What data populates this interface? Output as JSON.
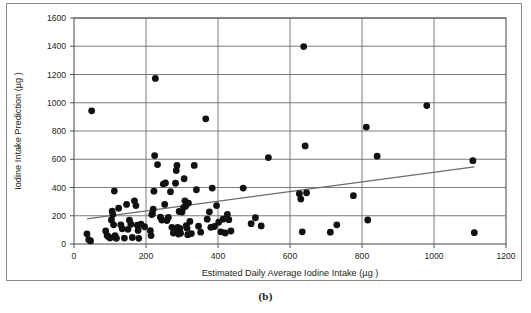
{
  "figure": {
    "caption": "(b)",
    "background_color": "#ffffff",
    "frame_color": "#8a8a8a"
  },
  "chart_data": {
    "type": "scatter",
    "title": "",
    "xlabel": "Estimated Daily Average Iodine Intake (µg )",
    "ylabel": "Iodine Intake Prediction (µg )",
    "xlim": [
      0,
      1200
    ],
    "ylim": [
      0,
      1600
    ],
    "xticks": [
      0,
      200,
      400,
      600,
      800,
      1000,
      1200
    ],
    "yticks": [
      0,
      200,
      400,
      600,
      800,
      1000,
      1200,
      1400,
      1600
    ],
    "xtick_labels": [
      "0",
      "200",
      "400",
      "600",
      "800",
      "1000",
      "1200"
    ],
    "ytick_labels": [
      "0",
      "200",
      "400",
      "600",
      "800",
      "1000",
      "1200",
      "1400",
      "1600"
    ],
    "grid": true,
    "grid_color": "#6d6d6d",
    "legend": null,
    "marker_color": "#111111",
    "marker_size": 3.4,
    "series": [
      {
        "name": "Iodine intake prediction vs estimated daily average iodine intake",
        "points": [
          [
            36,
            72
          ],
          [
            41,
            30
          ],
          [
            46,
            22
          ],
          [
            49,
            943
          ],
          [
            88,
            92
          ],
          [
            92,
            60
          ],
          [
            96,
            52
          ],
          [
            100,
            42
          ],
          [
            104,
            170
          ],
          [
            106,
            232
          ],
          [
            108,
            208
          ],
          [
            110,
            136
          ],
          [
            112,
            375
          ],
          [
            114,
            60
          ],
          [
            116,
            44
          ],
          [
            118,
            40
          ],
          [
            124,
            253
          ],
          [
            130,
            136
          ],
          [
            134,
            108
          ],
          [
            140,
            42
          ],
          [
            146,
            280
          ],
          [
            150,
            104
          ],
          [
            154,
            168
          ],
          [
            158,
            140
          ],
          [
            162,
            46
          ],
          [
            168,
            306
          ],
          [
            172,
            272
          ],
          [
            176,
            133
          ],
          [
            178,
            96
          ],
          [
            180,
            40
          ],
          [
            186,
            140
          ],
          [
            196,
            122
          ],
          [
            212,
            94
          ],
          [
            214,
            60
          ],
          [
            216,
            208
          ],
          [
            218,
            214
          ],
          [
            220,
            246
          ],
          [
            222,
            374
          ],
          [
            224,
            626
          ],
          [
            226,
            1172
          ],
          [
            232,
            562
          ],
          [
            240,
            190
          ],
          [
            244,
            170
          ],
          [
            248,
            424
          ],
          [
            252,
            280
          ],
          [
            254,
            432
          ],
          [
            258,
            166
          ],
          [
            262,
            188
          ],
          [
            268,
            370
          ],
          [
            272,
            118
          ],
          [
            276,
            78
          ],
          [
            278,
            104
          ],
          [
            282,
            430
          ],
          [
            284,
            520
          ],
          [
            286,
            556
          ],
          [
            288,
            118
          ],
          [
            290,
            70
          ],
          [
            292,
            230
          ],
          [
            294,
            110
          ],
          [
            296,
            76
          ],
          [
            300,
            226
          ],
          [
            304,
            258
          ],
          [
            306,
            462
          ],
          [
            308,
            306
          ],
          [
            310,
            268
          ],
          [
            312,
            130
          ],
          [
            314,
            112
          ],
          [
            316,
            66
          ],
          [
            318,
            290
          ],
          [
            322,
            160
          ],
          [
            326,
            74
          ],
          [
            334,
            556
          ],
          [
            340,
            384
          ],
          [
            346,
            126
          ],
          [
            352,
            84
          ],
          [
            366,
            886
          ],
          [
            370,
            176
          ],
          [
            376,
            228
          ],
          [
            380,
            118
          ],
          [
            384,
            396
          ],
          [
            390,
            124
          ],
          [
            396,
            272
          ],
          [
            402,
            154
          ],
          [
            408,
            86
          ],
          [
            414,
            176
          ],
          [
            420,
            78
          ],
          [
            426,
            210
          ],
          [
            430,
            172
          ],
          [
            436,
            92
          ],
          [
            470,
            396
          ],
          [
            492,
            144
          ],
          [
            504,
            186
          ],
          [
            520,
            128
          ],
          [
            540,
            612
          ],
          [
            626,
            356
          ],
          [
            630,
            318
          ],
          [
            634,
            86
          ],
          [
            638,
            1398
          ],
          [
            642,
            694
          ],
          [
            646,
            362
          ],
          [
            712,
            84
          ],
          [
            730,
            136
          ],
          [
            776,
            342
          ],
          [
            812,
            828
          ],
          [
            816,
            170
          ],
          [
            842,
            622
          ],
          [
            980,
            980
          ],
          [
            1108,
            590
          ],
          [
            1112,
            80
          ]
        ]
      }
    ],
    "trendline": {
      "name": "linear trend",
      "color": "#6b6b6b",
      "x_start": 36,
      "y_start": 178,
      "x_end": 1112,
      "y_end": 546
    }
  }
}
